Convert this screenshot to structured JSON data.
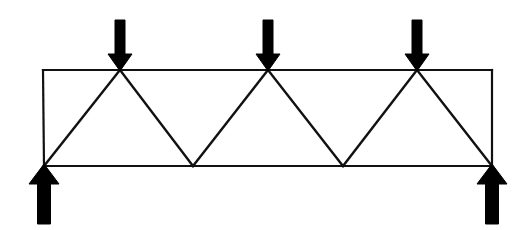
{
  "figure": {
    "type": "structural-engineering-diagram",
    "width": 527,
    "height": 230,
    "background_color": "#ffffff",
    "line_color": "#111111",
    "arrow_color": "#000000",
    "chord_stroke_width": 2.2,
    "diagonal_stroke_width": 2.4
  },
  "truss": {
    "span_label": "",
    "top_chord": {
      "y": 70,
      "x_start": 43,
      "x_end": 492
    },
    "bottom_chord": {
      "y": 166,
      "x_start": 44,
      "x_end": 492
    },
    "top_nodes": [
      {
        "id": "T1",
        "x": 120,
        "y": 70,
        "loaded": true
      },
      {
        "id": "T2",
        "x": 268,
        "y": 70,
        "loaded": true
      },
      {
        "id": "T3",
        "x": 417,
        "y": 70,
        "loaded": true
      }
    ],
    "bottom_nodes": [
      {
        "id": "B1",
        "x": 44,
        "y": 166,
        "support": true
      },
      {
        "id": "B2",
        "x": 193,
        "y": 166,
        "support": false
      },
      {
        "id": "B3",
        "x": 343,
        "y": 166,
        "support": false
      },
      {
        "id": "B4",
        "x": 492,
        "y": 166,
        "support": true
      }
    ],
    "end_posts": [
      {
        "id": "L-post",
        "x1": 43,
        "y1": 70,
        "x2": 44,
        "y2": 166
      },
      {
        "id": "R-post",
        "x1": 492,
        "y1": 70,
        "x2": 492,
        "y2": 166
      }
    ],
    "diagonals": [
      {
        "id": "D1",
        "x1": 44,
        "y1": 166,
        "x2": 120,
        "y2": 70
      },
      {
        "id": "D2",
        "x1": 120,
        "y1": 70,
        "x2": 193,
        "y2": 166
      },
      {
        "id": "D3",
        "x1": 193,
        "y1": 166,
        "x2": 268,
        "y2": 70
      },
      {
        "id": "D4",
        "x1": 268,
        "y1": 70,
        "x2": 343,
        "y2": 166
      },
      {
        "id": "D5",
        "x1": 343,
        "y1": 166,
        "x2": 417,
        "y2": 70
      },
      {
        "id": "D6",
        "x1": 417,
        "y1": 70,
        "x2": 492,
        "y2": 166
      }
    ]
  },
  "loads": {
    "direction": "down",
    "label": "",
    "arrows": [
      {
        "id": "P1",
        "x": 120,
        "tail_y": 20,
        "tip_y": 71,
        "shaft_width": 10,
        "head_width": 24,
        "head_length": 17
      },
      {
        "id": "P2",
        "x": 268,
        "tail_y": 20,
        "tip_y": 71,
        "shaft_width": 10,
        "head_width": 24,
        "head_length": 17
      },
      {
        "id": "P3",
        "x": 417,
        "tail_y": 20,
        "tip_y": 71,
        "shaft_width": 10,
        "head_width": 24,
        "head_length": 17
      }
    ]
  },
  "reactions": {
    "direction": "up",
    "label": "",
    "arrows": [
      {
        "id": "R1",
        "x": 44,
        "tail_y": 224,
        "tip_y": 164,
        "shaft_width": 13,
        "head_width": 30,
        "head_length": 20
      },
      {
        "id": "R2",
        "x": 492,
        "tail_y": 224,
        "tip_y": 164,
        "shaft_width": 13,
        "head_width": 30,
        "head_length": 20
      }
    ]
  }
}
